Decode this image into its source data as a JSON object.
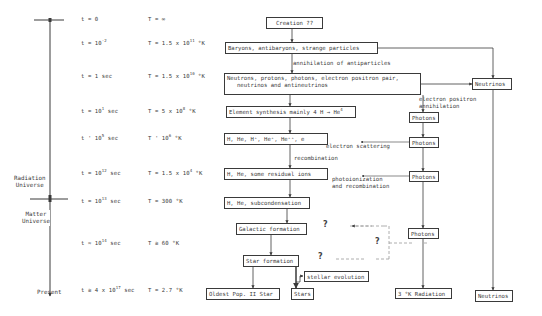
{
  "timeline": {
    "side_labels": {
      "radiation": [
        "Radiation",
        "Universe"
      ],
      "matter": [
        "Matter",
        "Universe"
      ],
      "present": "Present"
    },
    "rows": [
      {
        "t": "t = 0",
        "T": "T = ∞"
      },
      {
        "t": "t = 10",
        "t_exp": "-2",
        "T": "T = 1.5 x 10",
        "T_exp": "11",
        "T_unit": " °K"
      },
      {
        "t": "t = 1 sec",
        "T": "T = 1.5 x 10",
        "T_exp": "10",
        "T_unit": " °K"
      },
      {
        "t": "t = 10",
        "t_exp": "1",
        "t_unit": " sec",
        "T": "T = 5 x 10",
        "T_exp": "8",
        "T_unit": " °K"
      },
      {
        "t": "t ' 10",
        "t_exp": "5",
        "t_unit": " sec",
        "T": "T ' 10",
        "T_exp": "6",
        "T_unit": " °K"
      },
      {
        "t": "t = 10",
        "t_exp": "12",
        "t_unit": " sec",
        "T": "T = 1.5 x 10",
        "T_exp": "4",
        "T_unit": " °K"
      },
      {
        "t": "t = 10",
        "t_exp": "13",
        "t_unit": " sec",
        "T": "T = 300 °K"
      },
      {
        "t": "t ≈ 10",
        "t_exp": "14",
        "t_unit": " sec",
        "T": "T ≅ 60 °K"
      },
      {
        "t": "t ≅ 4 x 10",
        "t_exp": "17",
        "t_unit": " sec",
        "T": "T = 2.7 °K"
      }
    ]
  },
  "boxes": {
    "creation": "Creation ??",
    "baryons": "Baryons, antibaryons, strange particles",
    "neutrons_line1": "Neutrons, protons, photons, electron positron pair,",
    "neutrons_line2": "neutrinos and antineutrinos",
    "element_synthesis": "Element synthesis mainly 4 H → He",
    "element_synthesis_exp": "4",
    "ions": "H, He, H⁺, He⁺, He⁺⁺, e",
    "residual": "H, He, some residual ions",
    "subcondensation": "H, He, subcondensation",
    "galactic": "Galactic formation",
    "star_formation": "Star formation",
    "stellar_evolution": "stellar evolution",
    "oldest": "Oldest Pop. II Star",
    "stars": "Stars",
    "neutrinos_top": "Neutrinos",
    "neutrinos_bottom": "Neutrinos",
    "photons_1": "Photons",
    "photons_2": "Photons",
    "photons_3": "Photons",
    "photons_4": "Photons",
    "radiation_3k": "3 °K Radiation"
  },
  "annotations": {
    "annihilation": "annihilation of antiparticles",
    "ep_annihilation": [
      "electron positron",
      "annihilation"
    ],
    "electron_scattering": "electron scattering",
    "recombination": "recombination",
    "photoionization": [
      "photoionization",
      "and recombination"
    ],
    "question": "?"
  },
  "colors": {
    "ink": "#3a3a3a",
    "dashed": "#9a9a9a",
    "background": "#ffffff"
  }
}
